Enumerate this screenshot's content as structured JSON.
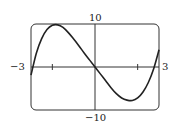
{
  "chart_data": {
    "type": "line",
    "title": "",
    "xlabel": "",
    "ylabel": "",
    "xlim": [
      -3,
      3
    ],
    "ylim": [
      -10,
      10
    ],
    "grid": false,
    "legend": null,
    "x_tick_labels": [
      "-3",
      "3"
    ],
    "y_tick_labels": [
      "10",
      "-10"
    ],
    "x_ticks": [
      -2,
      2
    ],
    "series": [
      {
        "name": "f(x)",
        "x": [
          -3.0,
          -2.75,
          -2.5,
          -2.25,
          -2.0,
          -1.75,
          -1.5,
          -1.25,
          -1.0,
          -0.75,
          -0.5,
          -0.25,
          0.0,
          0.25,
          0.5,
          0.75,
          1.0,
          1.25,
          1.5,
          1.75,
          2.0,
          2.25,
          2.5,
          2.75,
          3.0
        ],
        "y": [
          -1.9,
          3.2,
          6.6,
          8.7,
          9.7,
          9.8,
          9.2,
          8.0,
          6.5,
          4.9,
          3.2,
          1.6,
          0.0,
          -1.6,
          -3.2,
          -4.8,
          -6.2,
          -7.2,
          -7.7,
          -7.8,
          -7.2,
          -5.8,
          -3.6,
          -0.4,
          4.0
        ]
      }
    ]
  },
  "labels": {
    "x_min": "−3",
    "x_max": "3",
    "y_max": "10",
    "y_min": "−10"
  }
}
